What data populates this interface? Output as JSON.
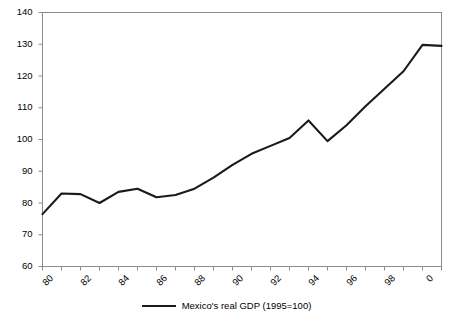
{
  "chart_data": {
    "type": "line",
    "title": "",
    "subtitle": "",
    "xlabel": "",
    "ylabel": "",
    "xlim": [
      1980,
      2001
    ],
    "ylim": [
      60,
      140
    ],
    "ytick_values": [
      60,
      70,
      80,
      90,
      100,
      110,
      120,
      130,
      140
    ],
    "ytick_labels": [
      "60",
      "70",
      "80",
      "90",
      "100",
      "110",
      "120",
      "130",
      "140"
    ],
    "xtick_values": [
      1980,
      1982,
      1984,
      1986,
      1988,
      1990,
      1992,
      1994,
      1996,
      1998,
      2000
    ],
    "xtick_labels": [
      "80",
      "82",
      "84",
      "86",
      "88",
      "90",
      "92",
      "94",
      "96",
      "98",
      "0"
    ],
    "xtick_all_values": [
      1980,
      1981,
      1982,
      1983,
      1984,
      1985,
      1986,
      1987,
      1988,
      1989,
      1990,
      1991,
      1992,
      1993,
      1994,
      1995,
      1996,
      1997,
      1998,
      1999,
      2000,
      2001
    ],
    "grid": false,
    "legend_position": "bottom-center",
    "series": [
      {
        "name": "Mexico's real GDP (1995=100)",
        "color": "#1a1a1a",
        "x": [
          1980,
          1981,
          1982,
          1983,
          1984,
          1985,
          1986,
          1987,
          1988,
          1989,
          1990,
          1991,
          1992,
          1993,
          1994,
          1995,
          1996,
          1997,
          1998,
          1999,
          2000,
          2001
        ],
        "values": [
          76.5,
          83,
          82.8,
          80,
          83.5,
          84.5,
          81.8,
          82.5,
          84.5,
          88,
          92,
          95.5,
          98,
          100.5,
          106,
          99.5,
          104.5,
          110.5,
          116,
          121.5,
          129.8,
          129.5
        ]
      }
    ]
  },
  "legend": {
    "entry_label": "Mexico's real GDP (1995=100)",
    "swatch_color": "#1a1a1a"
  },
  "axes": {
    "axis_color": "#8c8c8c",
    "tick_color": "#8c8c8c",
    "frame_color": "#8c8c8c"
  }
}
